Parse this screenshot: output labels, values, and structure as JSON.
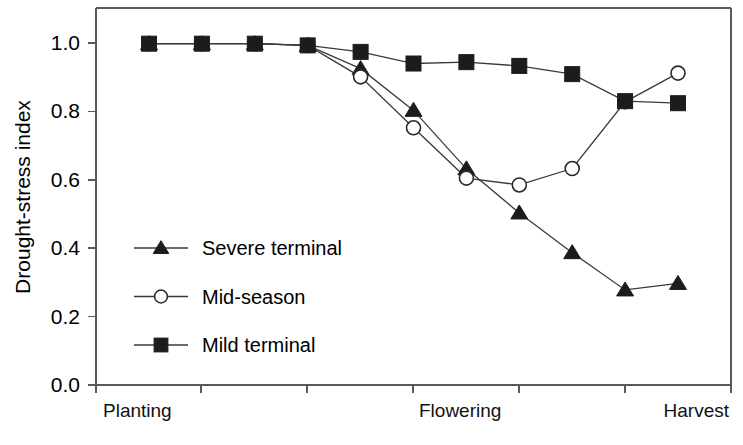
{
  "chart_data": {
    "type": "line",
    "title": "",
    "subtitle": "",
    "xlabel": "",
    "ylabel": "Drought-stress index",
    "ylim": [
      0.0,
      1.0
    ],
    "grid": false,
    "legend_position": "inside-left-middle",
    "x_tick_labels": [
      "Planting",
      "",
      "",
      "Flowering",
      "",
      "",
      "Harvest"
    ],
    "x_category_labels": [
      {
        "label": "Planting",
        "x_index": 0
      },
      {
        "label": "Flowering",
        "x_index": 3
      },
      {
        "label": "Harvest",
        "x_index": 6
      }
    ],
    "y_tick_labels": [
      "0.0",
      "0.2",
      "0.4",
      "0.6",
      "0.8",
      "1.0"
    ],
    "y_tick_values": [
      0.0,
      0.2,
      0.4,
      0.6,
      0.8,
      1.0
    ],
    "x": [
      0,
      1,
      2,
      3,
      4,
      5,
      6,
      7,
      8,
      9,
      10
    ],
    "series": [
      {
        "name": "Severe terminal",
        "marker": "triangle-filled",
        "color": "#1c1c1c",
        "values": [
          0.998,
          0.998,
          0.998,
          0.993,
          0.925,
          0.803,
          0.632,
          0.503,
          0.387,
          0.278,
          0.297
        ]
      },
      {
        "name": "Mid-season",
        "marker": "circle-open",
        "color": "#2a2a2a",
        "values": [
          0.998,
          0.998,
          0.998,
          0.993,
          0.901,
          0.752,
          0.605,
          0.585,
          0.633,
          0.828,
          0.912
        ]
      },
      {
        "name": "Mild terminal",
        "marker": "square-filled",
        "color": "#1c1c1c",
        "values": [
          0.998,
          0.998,
          0.998,
          0.993,
          0.974,
          0.94,
          0.944,
          0.933,
          0.909,
          0.83,
          0.824
        ]
      }
    ]
  },
  "legend": {
    "items": [
      {
        "label": "Severe terminal",
        "marker": "triangle-filled"
      },
      {
        "label": "Mid-season",
        "marker": "circle-open"
      },
      {
        "label": "Mild terminal",
        "marker": "square-filled"
      }
    ]
  },
  "axes": {
    "y_title": "Drought-stress index"
  }
}
